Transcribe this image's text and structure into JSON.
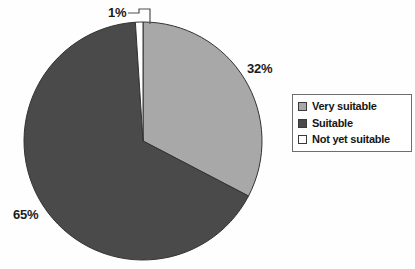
{
  "chart_data": {
    "type": "pie",
    "title": "",
    "categories": [
      "Very suitable",
      "Suitable",
      "Not yet suitable"
    ],
    "values": [
      32,
      65,
      1
    ],
    "value_labels": [
      "32%",
      "65%",
      "1%"
    ],
    "unit": "%",
    "colors": [
      "#a8a8a8",
      "#4a4a4a",
      "#ffffff"
    ],
    "legend": {
      "position": "right",
      "entries": [
        {
          "label": "Very suitable",
          "color": "#a8a8a8",
          "border": "#3a3a3a"
        },
        {
          "label": "Suitable",
          "color": "#4a4a4a",
          "border": "#3a3a3a"
        },
        {
          "label": "Not yet suitable",
          "color": "#ffffff",
          "border": "#3a3a3a"
        }
      ]
    },
    "grid": false,
    "start_angle_deg": 0,
    "direction": "clockwise",
    "leader_lines": [
      "1%"
    ]
  },
  "labels": {
    "very_suitable_pct": "32%",
    "suitable_pct": "65%",
    "not_yet_suitable_pct": "1%"
  },
  "legend": {
    "items": [
      {
        "label": "Very suitable"
      },
      {
        "label": "Suitable"
      },
      {
        "label": "Not yet suitable"
      }
    ]
  },
  "colors": {
    "very_suitable": "#a8a8a8",
    "suitable": "#4a4a4a",
    "not_yet_suitable": "#ffffff",
    "slice_outline": "#333333",
    "text": "#161616",
    "background": "#fefefe"
  }
}
